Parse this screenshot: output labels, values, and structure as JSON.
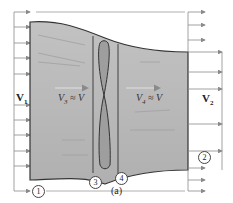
{
  "diagram": {
    "caption": "(a)",
    "labels": {
      "v1": {
        "main": "V",
        "sub": "1"
      },
      "v2": {
        "main": "V",
        "sub": "2"
      },
      "v3": {
        "main": "V",
        "sub": "3",
        "rel": " ≈ V"
      },
      "v4": {
        "main": "V",
        "sub": "4",
        "rel": " ≈ V"
      }
    },
    "stations": [
      "1",
      "2",
      "3",
      "4"
    ],
    "colors": {
      "streamtube_fill": "#b8b8b8",
      "outline": "#333333",
      "arrow": "#8a8a8a",
      "background": "#ffffff"
    },
    "inlet_arrows": 8,
    "outlet_arrows_top": 3,
    "outlet_arrows_mid": 3,
    "outlet_arrows_bottom": 3
  }
}
